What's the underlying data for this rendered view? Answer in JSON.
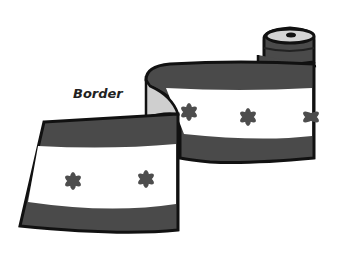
{
  "illustration": {
    "subject": "rolled fabric border ribbon",
    "label": "Border",
    "motif": "asterisk",
    "colors": {
      "band": "#4a4a4a",
      "outline": "#111111",
      "field": "#ffffff",
      "motif": "#4d4d4d",
      "inner_fold": "#cfcfcf",
      "background": "#ffffff"
    }
  }
}
